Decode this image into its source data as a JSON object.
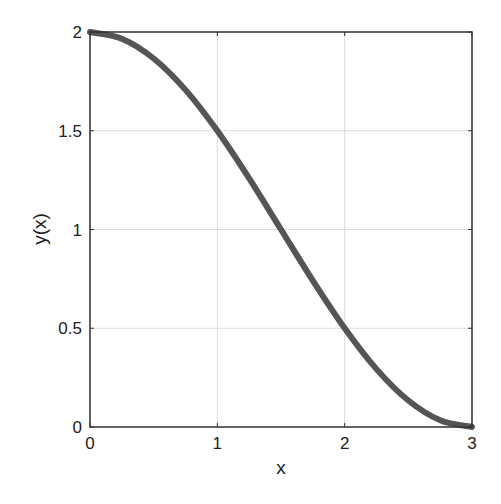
{
  "chart_data": {
    "type": "line",
    "title": "",
    "xlabel": "x",
    "ylabel": "y(x)",
    "xlim": [
      0,
      3
    ],
    "ylim": [
      0,
      2
    ],
    "xticks": [
      0,
      1,
      2,
      3
    ],
    "yticks": [
      0,
      0.5,
      1,
      1.5,
      2
    ],
    "xtick_labels": [
      "0",
      "1",
      "2",
      "3"
    ],
    "ytick_labels": [
      "0",
      "0.5",
      "1",
      "1.5",
      "2"
    ],
    "grid": true,
    "legend": null,
    "series": [
      {
        "name": "y(x)",
        "color": "#555555",
        "line_width": 6,
        "x": [
          0,
          0.25,
          0.5,
          0.75,
          1.0,
          1.25,
          1.5,
          1.75,
          2.0,
          2.25,
          2.5,
          2.75,
          3.0
        ],
        "values": [
          2.0,
          1.966,
          1.866,
          1.707,
          1.5,
          1.259,
          1.0,
          0.741,
          0.5,
          0.293,
          0.134,
          0.034,
          0.0
        ]
      }
    ]
  },
  "colors": {
    "axes": "#333333",
    "grid": "#dddddd",
    "line": "#555555",
    "background": "#ffffff"
  }
}
